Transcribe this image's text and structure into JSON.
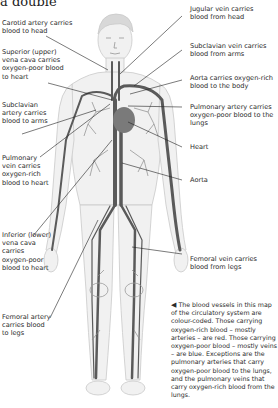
{
  "heading": "a double",
  "labels_left": [
    {
      "id": "carotid-artery",
      "text": "Carotid artery carries blood to head"
    },
    {
      "id": "superior-vena-cava",
      "text": "Superior (upper) vena cava carries oxygen-poor blood to heart"
    },
    {
      "id": "subclavian-artery",
      "text": "Subclavian artery carries blood to arms"
    },
    {
      "id": "pulmonary-vein",
      "text": "Pulmonary vein carries oxygen-rich blood to heart"
    },
    {
      "id": "inferior-vena-cava",
      "text": "Inferior (lower) vena cava carries oxygen-poor blood to heart"
    },
    {
      "id": "femoral-artery",
      "text": "Femoral artery carries blood to legs"
    }
  ],
  "labels_right": [
    {
      "id": "jugular-vein",
      "text": "Jugular vein carries blood from head"
    },
    {
      "id": "subclavian-vein",
      "text": "Subclavian vein carries blood from arms"
    },
    {
      "id": "aorta-oxygen",
      "text": "Aorta carries oxygen-rich blood to the body"
    },
    {
      "id": "pulmonary-artery",
      "text": "Pulmonary artery carries oxygen-poor blood to the lungs"
    },
    {
      "id": "heart",
      "text": "Heart"
    },
    {
      "id": "aorta",
      "text": "Aorta"
    },
    {
      "id": "femoral-vein",
      "text": "Femoral vein carries blood from legs"
    }
  ],
  "caption": {
    "arrow_icon": "◀",
    "text": "The blood vessels in this map of the circulatory system are colour-coded. Those carrying oxygen-rich blood – mostly arteries – are red. Those carrying oxygen-poor blood – mostly veins – are blue. Exceptions are the pulmonary arteries that carry oxygen-poor blood to the lungs, and the pulmonary veins that carry oxygen-rich blood from the lungs."
  }
}
